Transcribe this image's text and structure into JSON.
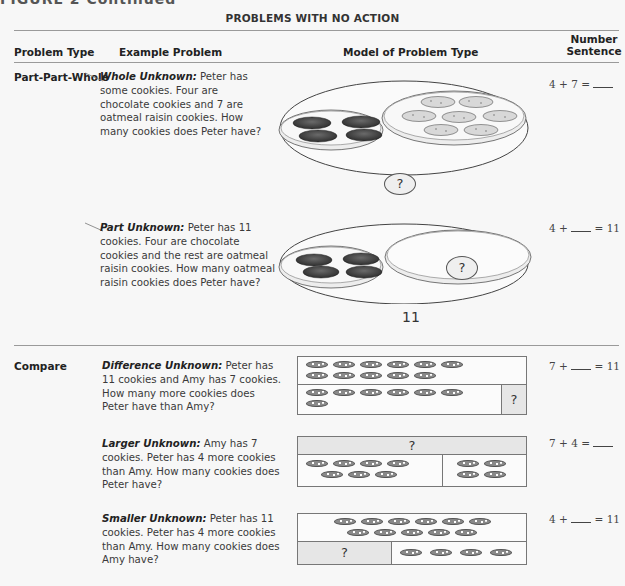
{
  "figure_label": "FIGURE 2  Continued",
  "section_title": "PROBLEMS WITH NO ACTION",
  "columns": {
    "problem_type": "Problem Type",
    "example_problem": "Example Problem",
    "model": "Model of Problem Type",
    "number_sentence_line1": "Number",
    "number_sentence_line2": "Sentence"
  },
  "groups": [
    {
      "type": "Part-Part-Whole",
      "problems": [
        {
          "label": "Whole Unknown:",
          "text": " Peter has some cookies. Four are chocolate cookies and 7 are oatmeal raisin cookies. How many cookies does Peter have?",
          "sentence_left": "4 + 7 = ",
          "sentence_right": "",
          "model": {
            "kind": "plates",
            "chocolate_count": 4,
            "oatmeal_count": 7,
            "unknown_label": "?",
            "total_label": ""
          }
        },
        {
          "label": "Part Unknown:",
          "text": " Peter has 11 cookies. Four are chocolate cookies and the rest are oatmeal raisin cookies. How many oatmeal raisin cookies does Peter have?",
          "sentence_left": "4 + ",
          "sentence_right": " = 11",
          "model": {
            "kind": "plates",
            "chocolate_count": 4,
            "oatmeal_count": 0,
            "unknown_label": "?",
            "total_label": "11"
          }
        }
      ]
    },
    {
      "type": "Compare",
      "problems": [
        {
          "label": "Difference Unknown:",
          "text": " Peter has 11 cookies and Amy has 7 cookies. How many more cookies does Peter have than Amy?",
          "sentence_left": "7 + ",
          "sentence_right": " = 11",
          "model": {
            "kind": "bar",
            "top_count": 11,
            "bottom_count": 7,
            "unknown_label": "?"
          }
        },
        {
          "label": "Larger Unknown:",
          "text": " Amy has 7 cookies. Peter has 4 more cookies than Amy. How many cookies does Peter have?",
          "sentence_left": "7 + 4 = ",
          "sentence_right": "",
          "model": {
            "kind": "bar",
            "top_label": "?",
            "bottom_left_count": 7,
            "bottom_right_count": 4
          }
        },
        {
          "label": "Smaller Unknown:",
          "text": " Peter has 11 cookies. Peter has 4 more cookies than Amy. How many cookies does Amy have?",
          "sentence_left": "4 + ",
          "sentence_right": " = 11",
          "model": {
            "kind": "bar",
            "top_count": 11,
            "bottom_unknown_label": "?",
            "bottom_right_count": 4
          }
        }
      ]
    }
  ]
}
